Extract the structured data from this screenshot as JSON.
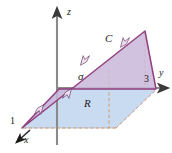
{
  "figure": {
    "axes": {
      "z": {
        "label": "z",
        "color": "#6d6d6d"
      },
      "y": {
        "label": "y",
        "color": "#6d6d6d"
      },
      "x": {
        "label": "x",
        "color": "#2b2b2b"
      }
    },
    "ticks": {
      "y_tick": "3",
      "x_tick": "1"
    },
    "labels": {
      "surface": "σ",
      "region": "R",
      "curve": "C"
    },
    "colors": {
      "surface_fill": "#c9b7d9",
      "surface_stroke": "#93407f",
      "region_fill": "#c3d8ef",
      "region_stroke": "#8fb6dd",
      "axis_gray": "#6d6d6d",
      "dashed_orange": "#e08a43",
      "arrow_dark": "#1b1b1b",
      "page_background": "#ffffff"
    },
    "geometry": {
      "origin": [
        57,
        88
      ],
      "z_axis_tip": [
        57,
        9
      ],
      "y_axis_tip": [
        168,
        88
      ],
      "x_axis_tip": [
        17,
        142
      ],
      "region_polygon": "22,128 116,128 156,89 59,89",
      "surface_polygon": "22,128 145,31 156,89 59,89",
      "curve_arrow_count": 4
    }
  }
}
